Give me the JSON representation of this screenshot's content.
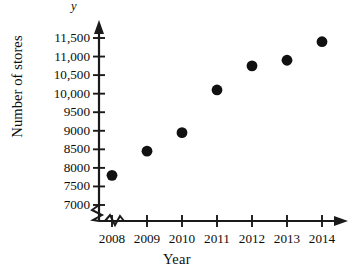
{
  "chart_data": {
    "type": "scatter",
    "title": "",
    "xlabel": "Year",
    "ylabel": "Number of stores",
    "y_axis_variable": "y",
    "categories": [
      2008,
      2009,
      2010,
      2011,
      2012,
      2013,
      2014
    ],
    "x": [
      2008,
      2009,
      2010,
      2011,
      2012,
      2013,
      2014
    ],
    "values": [
      7800,
      8450,
      8950,
      10100,
      10750,
      10900,
      11400
    ],
    "series": [
      {
        "name": "Number of stores",
        "values": [
          7800,
          8450,
          8950,
          10100,
          10750,
          10900,
          11400
        ]
      }
    ],
    "points": [
      {
        "x": 2008,
        "y": 7800
      },
      {
        "x": 2009,
        "y": 8450
      },
      {
        "x": 2010,
        "y": 8950
      },
      {
        "x": 2011,
        "y": 10100
      },
      {
        "x": 2012,
        "y": 10750
      },
      {
        "x": 2013,
        "y": 10900
      },
      {
        "x": 2014,
        "y": 11400
      }
    ],
    "ylim": [
      7000,
      11500
    ],
    "xlim": [
      2008,
      2014
    ],
    "ytick_labels": [
      "11,500",
      "11,000",
      "10,500",
      "10,000",
      "9500",
      "9000",
      "8500",
      "8000",
      "7500",
      "7000"
    ],
    "ytick_values": [
      11500,
      11000,
      10500,
      10000,
      9500,
      9000,
      8500,
      8000,
      7500,
      7000
    ],
    "xtick_labels": [
      "2008",
      "2009",
      "2010",
      "2011",
      "2012",
      "2013",
      "2014"
    ],
    "xtick_values": [
      2008,
      2009,
      2010,
      2011,
      2012,
      2013,
      2014
    ],
    "grid": false,
    "legend": "none",
    "axis_break_y": true,
    "axis_break_x": true,
    "marker": "filled-circle",
    "marker_color": "#111111",
    "axis_color": "#1a1a1a"
  }
}
